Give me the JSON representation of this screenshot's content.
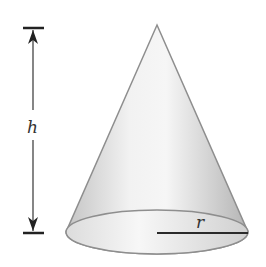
{
  "figure": {
    "type": "cone",
    "labels": {
      "height": "h",
      "radius": "r"
    },
    "colors": {
      "outline": "#8a8a8a",
      "dimension": "#2a2a2a",
      "surface_light": "#f4f4f4",
      "surface_dark": "#bdbdbd"
    }
  }
}
